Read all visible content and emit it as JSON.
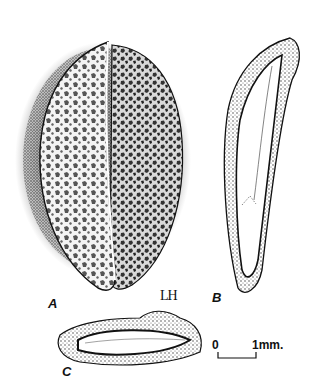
{
  "figure": {
    "panels": [
      {
        "id": "A",
        "label": "A",
        "description": "whole seed, surface view with reticulate pattern"
      },
      {
        "id": "B",
        "label": "B",
        "description": "longitudinal section"
      },
      {
        "id": "C",
        "label": "C",
        "description": "cross section"
      }
    ],
    "artist_signature": "LH",
    "scale_bar": {
      "start_label": "0",
      "end_label": "1mm."
    },
    "colors": {
      "ink": "#111111",
      "paper": "#ffffff",
      "shade": "#555555"
    }
  }
}
